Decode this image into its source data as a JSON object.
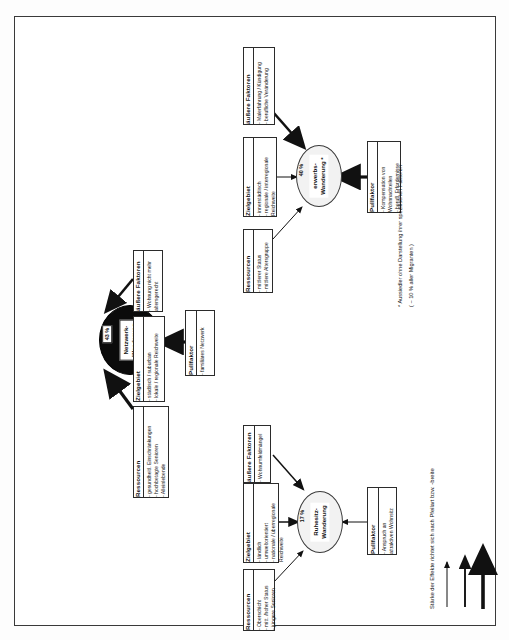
{
  "document": {
    "title": "Typen der Altersmigration",
    "orientation": "landscape-rotated"
  },
  "nodes": [
    {
      "id": "netzwerk",
      "label": "Netzwerk-\nWanderung",
      "label_line1": "Netzwerk-",
      "label_line2": "Wanderung",
      "percent": "43 %",
      "style": "dark"
    },
    {
      "id": "erwerbs",
      "label_line1": "erwerbs-",
      "label_line2": "Wanderung *",
      "percent": "40 %",
      "style": "light"
    },
    {
      "id": "ruhesitz",
      "label_line1": "Ruhesitz-",
      "label_line2": "Wanderung",
      "percent": "17 %",
      "style": "light"
    }
  ],
  "boxes": {
    "netzwerk_aussere": {
      "title": "äußere Faktoren",
      "lines": [
        "- Wohnung nicht mehr",
        "  altersgerecht"
      ]
    },
    "netzwerk_zielgebiet": {
      "title": "Zielgebiet",
      "lines": [
        "- städtisch / suburban",
        "- lokale / regionale Reichweite"
      ]
    },
    "netzwerk_ressourcen": {
      "title": "Ressourcen",
      "lines": [
        "- gesundheitl. Einschränkungen",
        "- hochbetagte Senioren",
        "- Alleinlebende"
      ]
    },
    "netzwerk_pullfaktor": {
      "title": "Pullfaktor",
      "lines": [
        "- familiäres Netzwerk"
      ]
    },
    "erwerbs_aussere": {
      "title": "äußere Faktoren",
      "lines": [
        "- Malerfahrung / Kündigung",
        "- berufliche Veränderung"
      ]
    },
    "erwerbs_zielgebiet": {
      "title": "Zielgebiet",
      "lines": [
        "- innerstädtisch",
        "- regionale / interregionale",
        "  Reichweite"
      ]
    },
    "erwerbs_ressourcen": {
      "title": "Ressourcen",
      "lines": [
        "- mittlerer Status",
        "- mittlere Altersgruppe"
      ]
    },
    "erwerbs_pullfaktor": {
      "title": "Pullfaktor",
      "lines": [
        "- Kompensation von",
        "  Wohnnachteilen",
        "- berufl. Erfordernisse"
      ]
    },
    "ruhesitz_aussere": {
      "title": "äußere Faktoren",
      "lines": [
        "- Wohnumfeldmängel"
      ]
    },
    "ruhesitz_zielgebiet": {
      "title": "Zielgebiet",
      "lines": [
        "- ländlich",
        "- umweltorientiert",
        "- nationale / überregionale",
        "  Reichweite"
      ]
    },
    "ruhesitz_ressourcen": {
      "title": "Ressourcen",
      "lines": [
        "- Oberschicht",
        "- mitt. /hoher Status",
        "- jüngere Senioren"
      ]
    },
    "ruhesitz_pullfaktor": {
      "title": "Pullfaktor",
      "lines": [
        "- Anspruch an",
        "  attraktiven Wohnsitz"
      ]
    }
  },
  "footnote": {
    "line1": "* Aussiedler ohne Darstellung ihrer spezifischen Faktoren",
    "line2": "( ~ 10 % aller Migranten )"
  },
  "legend": {
    "caption": "Stärke der Effekte richtet sich nach Pfeilart bzw. -breite",
    "arrows": [
      "thin",
      "medium",
      "thick"
    ]
  },
  "colors": {
    "ink": "#111111",
    "node_dark": "#0b0b0b",
    "node_light": "#f2f2f2",
    "border": "#2b2b2b",
    "page": "#ffffff"
  }
}
